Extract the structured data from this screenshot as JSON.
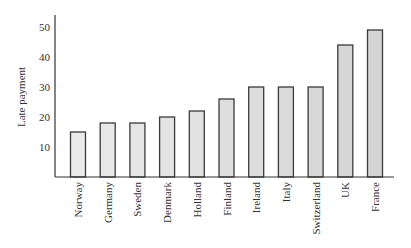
{
  "chart_data": {
    "type": "bar",
    "title": "",
    "xlabel": "",
    "ylabel": "Late payment",
    "categories": [
      "Norway",
      "Germany",
      "Sweden",
      "Denmark",
      "Holland",
      "Finland",
      "Ireland",
      "Italy",
      "Switzerland",
      "UK",
      "France"
    ],
    "values": [
      15,
      18,
      18,
      20,
      22,
      26,
      30,
      30,
      30,
      44,
      49
    ],
    "yticks": [
      10,
      20,
      30,
      40,
      50
    ],
    "ylim": [
      0,
      54
    ],
    "grid": false,
    "legend": null,
    "colors": {
      "bar_fill_light": "#e8e8e8",
      "bar_fill_dark": "#d2d2d2",
      "bar_stroke": "#3a3a3a",
      "axis": "#333333"
    }
  }
}
